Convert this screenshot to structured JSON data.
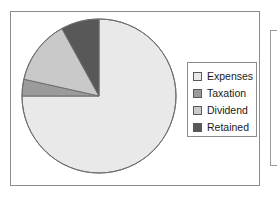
{
  "chart_data": {
    "type": "pie",
    "title": "",
    "subtitle": "",
    "xlabel": "",
    "ylabel": "",
    "grid": false,
    "legend_position": "right",
    "start_angle_deg": 90,
    "direction": "clockwise",
    "categories": [
      "Expenses",
      "Taxation",
      "Dividend",
      "Retained"
    ],
    "values": [
      75,
      3.5,
      13.5,
      8
    ],
    "slices": [
      {
        "label": "Expenses",
        "value": 75,
        "color": "#e9e9e9"
      },
      {
        "label": "Taxation",
        "value": 3.5,
        "color": "#9b9b9b"
      },
      {
        "label": "Dividend",
        "value": 13.5,
        "color": "#c9c9c9"
      },
      {
        "label": "Retained",
        "value": 8,
        "color": "#585858"
      }
    ]
  },
  "legend": {
    "items": [
      {
        "label": "Expenses",
        "color": "#e9e9e9"
      },
      {
        "label": "Taxation",
        "color": "#9b9b9b"
      },
      {
        "label": "Dividend",
        "color": "#c9c9c9"
      },
      {
        "label": "Retained",
        "color": "#585858"
      }
    ]
  },
  "colors": {
    "panel_border": "#8c8c8c",
    "slice_outline": "#6e6e6e",
    "background": "#ffffff",
    "text": "#1a1a1a"
  }
}
